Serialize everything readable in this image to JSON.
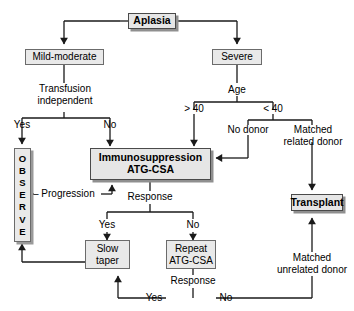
{
  "diagram": {
    "colors": {
      "box_fill": "#e9e9e9",
      "box_border": "#6b6b6b",
      "shadow": "#8f8f8f",
      "line": "#1a1a1a",
      "background": "#ffffff"
    },
    "nodes": {
      "aplasia": "Aplasia",
      "mild_moderate": "Mild-moderate",
      "severe": "Severe",
      "immunosuppression": "Immunosuppression\nATG-CSA",
      "transplant": "Transplant",
      "slow_taper": "Slow\ntaper",
      "repeat_atg": "Repeat\nATG-CSA",
      "observe_letters": [
        "O",
        "B",
        "S",
        "E",
        "R",
        "V",
        "E"
      ]
    },
    "labels": {
      "transfusion_independent": "Transfusion\nindependent",
      "yes_left": "Yes",
      "no_left": "No",
      "age": "Age",
      "gt40": "> 40",
      "lt40": "< 40",
      "no_donor": "No donor",
      "matched_related_donor": "Matched\nrelated donor",
      "matched_unrelated_donor": "Matched\nunrelated donor",
      "progression": "– Progression",
      "response_top": "Response",
      "yes_mid": "Yes",
      "no_mid": "No",
      "response_bottom": "Response",
      "yes_bottom": "Yes",
      "no_bottom": "No"
    }
  }
}
